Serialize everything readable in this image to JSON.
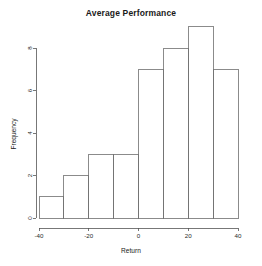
{
  "chart_data": {
    "type": "bar",
    "title": "Average Performance",
    "xlabel": "Return",
    "ylabel": "Frequency",
    "categories": [
      "-40 to -30",
      "-30 to -20",
      "-20 to -10",
      "-10 to 0",
      "0 to 10",
      "10 to 20",
      "20 to 30",
      "30 to 40"
    ],
    "bin_edges": [
      -40,
      -30,
      -20,
      -10,
      0,
      10,
      20,
      30,
      40
    ],
    "values": [
      1,
      2,
      3,
      3,
      7,
      8,
      9,
      7
    ],
    "xlim": [
      -40,
      40
    ],
    "ylim": [
      0,
      9
    ],
    "x_ticks": [
      -40,
      -20,
      0,
      20,
      40
    ],
    "x_tick_labels": [
      "-40",
      "-20",
      "0",
      "20",
      "40"
    ],
    "y_ticks": [
      0,
      2,
      4,
      6,
      8
    ],
    "y_tick_labels": [
      "0",
      "2",
      "4",
      "6",
      "8"
    ],
    "grid": false,
    "legend": false,
    "bar_fill_color": "#ffffff",
    "bar_stroke_color": "#6e6e6e",
    "axis_color": "#555555",
    "background_color": "#ffffff"
  }
}
